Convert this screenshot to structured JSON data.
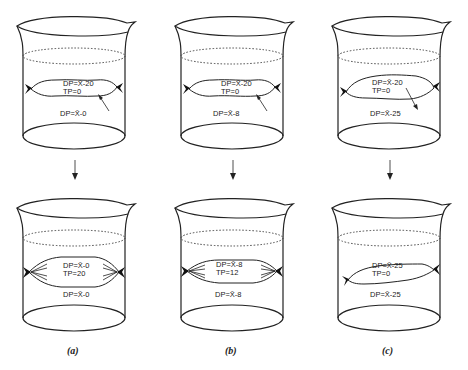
{
  "figure": {
    "panels": [
      {
        "caption": "(a)",
        "top": {
          "bag_dp": "DP=X̄-20",
          "bag_tp": "TP=0",
          "beaker_dp": "DP=X̄-0",
          "arrow": "inward"
        },
        "bottom": {
          "bag_dp": "DP=X̄-0",
          "bag_tp": "TP=20",
          "beaker_dp": "DP=X̄-0",
          "bag_state": "swollen"
        }
      },
      {
        "caption": "(b)",
        "top": {
          "bag_dp": "DP=X̄-20",
          "bag_tp": "TP=0",
          "beaker_dp": "DP=X̄-8",
          "arrow": "inward"
        },
        "bottom": {
          "bag_dp": "DP=X̄-8",
          "bag_tp": "TP=12",
          "beaker_dp": "DP=X̄-8",
          "bag_state": "partially swollen"
        }
      },
      {
        "caption": "(c)",
        "top": {
          "bag_dp": "DP=X̄-20",
          "bag_tp": "TP=0",
          "beaker_dp": "DP=X̄-25",
          "arrow": "outward"
        },
        "bottom": {
          "bag_dp": "DP=X̄-25",
          "bag_tp": "TP=0",
          "beaker_dp": "DP=X̄-25",
          "bag_state": "shrunken"
        }
      }
    ]
  }
}
